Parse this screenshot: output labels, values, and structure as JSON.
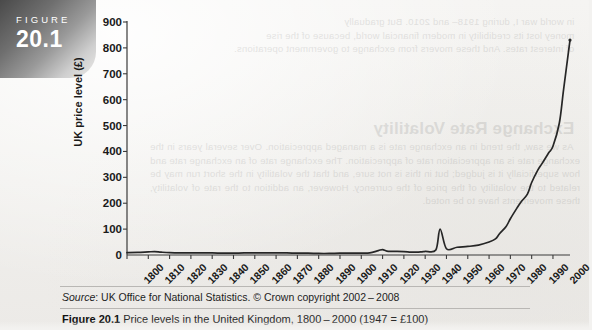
{
  "figure_tab": {
    "keyword": "FIGURE",
    "number": "20.1"
  },
  "source": {
    "prefix": "Source",
    "text": ": UK Office for National Statistics. © Crown copyright 2002 – 2008"
  },
  "caption": {
    "label": "Figure 20.1",
    "text": "Price levels in the United Kingdom, 1800 – 2000 (1947 = £100)"
  },
  "bleed_text": {
    "line1": "in world war I, during 1918– and 2010. But gradually",
    "line2": "money lost its credibility in modern financial world, because of the rise",
    "line3": "of interest rates. And these movers from exchange to government operations.",
    "heading": "Exchange Rate Volatility",
    "body": "As we saw, the trend in an exchange rate is a managed appreciation. Over several years in the exchange rate is an appreciation rate of appreciation. The exchange rate of an exchange rate and how superficially it is judged; but in this is not sure, and that the volatility in the short run may be related to the volatility of the price of the currency. However, an addition to the rate of volatility, these movements have to be noted."
  },
  "chart_data": {
    "type": "line",
    "xlabel": "",
    "ylabel": "UK price level (£)",
    "xlim": [
      1800,
      2008
    ],
    "ylim": [
      0,
      900
    ],
    "yticks": [
      0,
      100,
      200,
      300,
      400,
      500,
      600,
      700,
      800,
      900
    ],
    "xticks": [
      1800,
      1810,
      1820,
      1830,
      1840,
      1850,
      1860,
      1870,
      1880,
      1890,
      1900,
      1910,
      1920,
      1930,
      1940,
      1950,
      1960,
      1970,
      1980,
      1990,
      2000
    ],
    "grid": false,
    "legend": "none",
    "line_color": "#262626",
    "series": [
      {
        "name": "UK price level (£)",
        "x": [
          1800,
          1805,
          1810,
          1813,
          1816,
          1820,
          1825,
          1830,
          1835,
          1840,
          1845,
          1850,
          1855,
          1860,
          1865,
          1870,
          1875,
          1880,
          1885,
          1890,
          1895,
          1900,
          1905,
          1910,
          1914,
          1918,
          1920,
          1922,
          1925,
          1930,
          1933,
          1935,
          1938,
          1940,
          1945,
          1947,
          1950,
          1955,
          1960,
          1965,
          1970,
          1973,
          1975,
          1978,
          1980,
          1983,
          1985,
          1988,
          1990,
          1993,
          1995,
          1998,
          2000,
          2003,
          2005,
          2008
        ],
        "values": [
          9,
          10,
          12,
          13,
          11,
          9,
          8,
          8,
          8,
          8,
          7,
          7,
          8,
          8,
          8,
          8,
          8,
          7,
          7,
          6,
          6,
          7,
          7,
          7,
          8,
          17,
          21,
          15,
          14,
          13,
          11,
          11,
          12,
          14,
          19,
          100,
          24,
          30,
          33,
          38,
          50,
          62,
          83,
          110,
          140,
          180,
          205,
          235,
          280,
          330,
          355,
          395,
          420,
          510,
          640,
          830
        ]
      }
    ],
    "annotations": [
      {
        "x": 1813,
        "label": "Napoleonic wars peak"
      },
      {
        "x": 1920,
        "label": "World War I spike"
      },
      {
        "x": 1945,
        "label": "World War II rise"
      },
      {
        "x": 1975,
        "label": "Great Inflation acceleration"
      }
    ]
  }
}
